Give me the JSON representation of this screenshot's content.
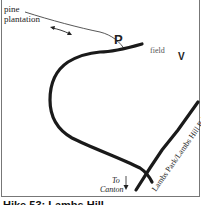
{
  "map": {
    "labels": {
      "pine_plantation": "pine plantation",
      "parking": "P",
      "field": "field",
      "viewpoint": "V",
      "to_canton": "To Canton",
      "to": "To",
      "canton": "Canton",
      "road": "Lambs Park/Lambs Hill Rd."
    },
    "caption": "Hike 53: Lambs Hill",
    "colors": {
      "trail": "#1a1a1a",
      "thin_trail": "#444444",
      "border": "#777777"
    }
  }
}
